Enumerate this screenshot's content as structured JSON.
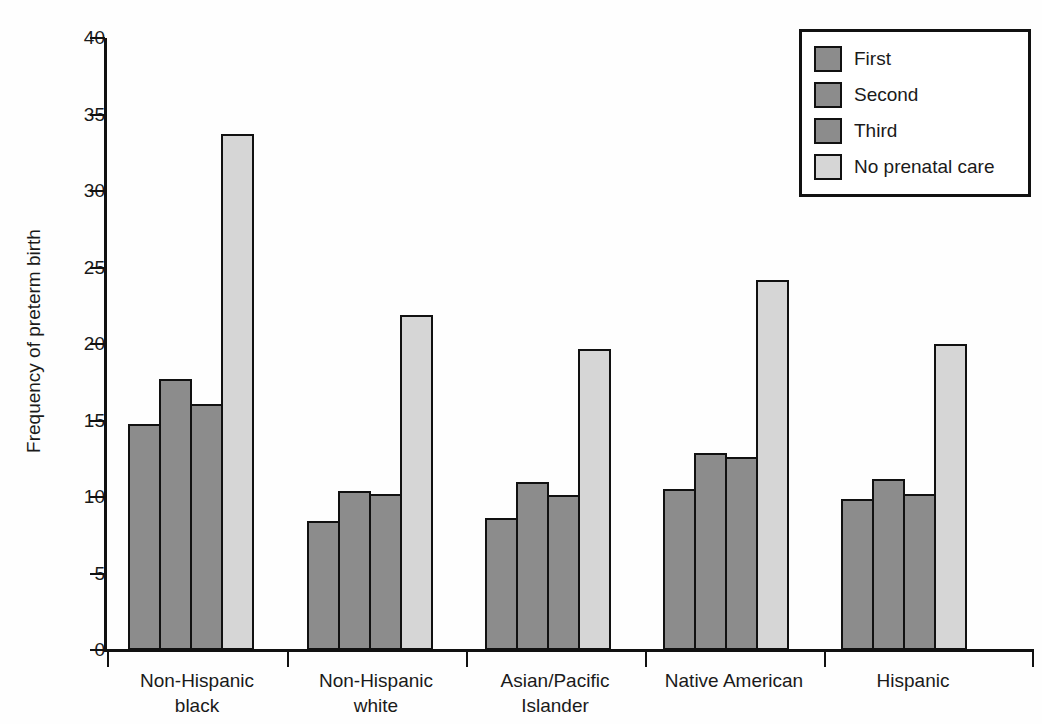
{
  "chart_data": {
    "type": "bar",
    "title": "",
    "subtitle": "",
    "xlabel": "",
    "ylabel": "Frequency of preterm birth",
    "ylim": [
      0,
      40
    ],
    "yticks": [
      0,
      5,
      10,
      15,
      20,
      25,
      30,
      35,
      40
    ],
    "ytick_labels": [
      "0",
      "5",
      "10",
      "15",
      "20",
      "25",
      "30",
      "35",
      "40"
    ],
    "grid": false,
    "legend_position": "top-right",
    "categories": [
      "Non-Hispanic black",
      "Non-Hispanic white",
      "Asian/Pacific Islander",
      "Native American",
      "Hispanic"
    ],
    "category_lines": [
      [
        "Non-Hispanic",
        "black"
      ],
      [
        "Non-Hispanic",
        "white"
      ],
      [
        "Asian/Pacific",
        "Islander"
      ],
      [
        "Native American"
      ],
      [
        "Hispanic"
      ]
    ],
    "series": [
      {
        "name": "First",
        "color": "#8c8c8c",
        "values": [
          14.8,
          8.4,
          8.6,
          10.5,
          9.9
        ]
      },
      {
        "name": "Second",
        "color": "#8c8c8c",
        "values": [
          17.7,
          10.4,
          11.0,
          12.9,
          11.2
        ]
      },
      {
        "name": "Third",
        "color": "#8c8c8c",
        "values": [
          16.1,
          10.2,
          10.1,
          12.6,
          10.2
        ]
      },
      {
        "name": "No prenatal care",
        "color": "#d6d6d6",
        "values": [
          33.7,
          21.9,
          19.7,
          24.2,
          20.0
        ]
      }
    ]
  },
  "legend": {
    "entries": [
      {
        "label": "First"
      },
      {
        "label": "Second"
      },
      {
        "label": "Third"
      },
      {
        "label": "No prenatal care"
      }
    ]
  },
  "colors": {
    "axis": "#111111",
    "series_dark": "#8c8c8c",
    "series_light": "#d6d6d6",
    "background": "#ffffff"
  }
}
